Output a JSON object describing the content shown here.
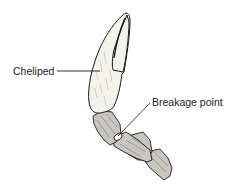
{
  "diagram": {
    "labels": [
      {
        "id": "cheliped",
        "text": "Cheliped"
      },
      {
        "id": "breakage",
        "text": "Breakage point"
      }
    ],
    "colors": {
      "background": "#ffffff",
      "ink": "#1a1a1a",
      "claw_fill": "#f4f2ec",
      "segment_fill": "#c9c6bf",
      "joint_fill": "#ffffff"
    }
  }
}
